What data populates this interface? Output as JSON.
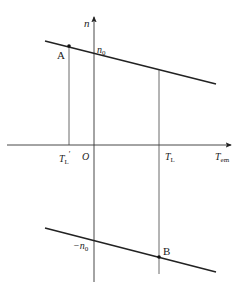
{
  "diagram": {
    "axes": {
      "y_label": "n",
      "x_label_main": "T",
      "x_label_sub": "em",
      "origin_label": "O"
    },
    "ticks": {
      "tl_prime_main": "T",
      "tl_prime_sub": "L",
      "tl_prime_mark": "′",
      "tl_main": "T",
      "tl_sub": "L"
    },
    "upper_line": {
      "intercept_label": "n",
      "intercept_sub": "0"
    },
    "lower_line": {
      "intercept_label": "−n",
      "intercept_sub": "0"
    },
    "points": {
      "A": "A",
      "B": "B"
    },
    "colors": {
      "line": "#222222",
      "thin": "#555555"
    }
  }
}
